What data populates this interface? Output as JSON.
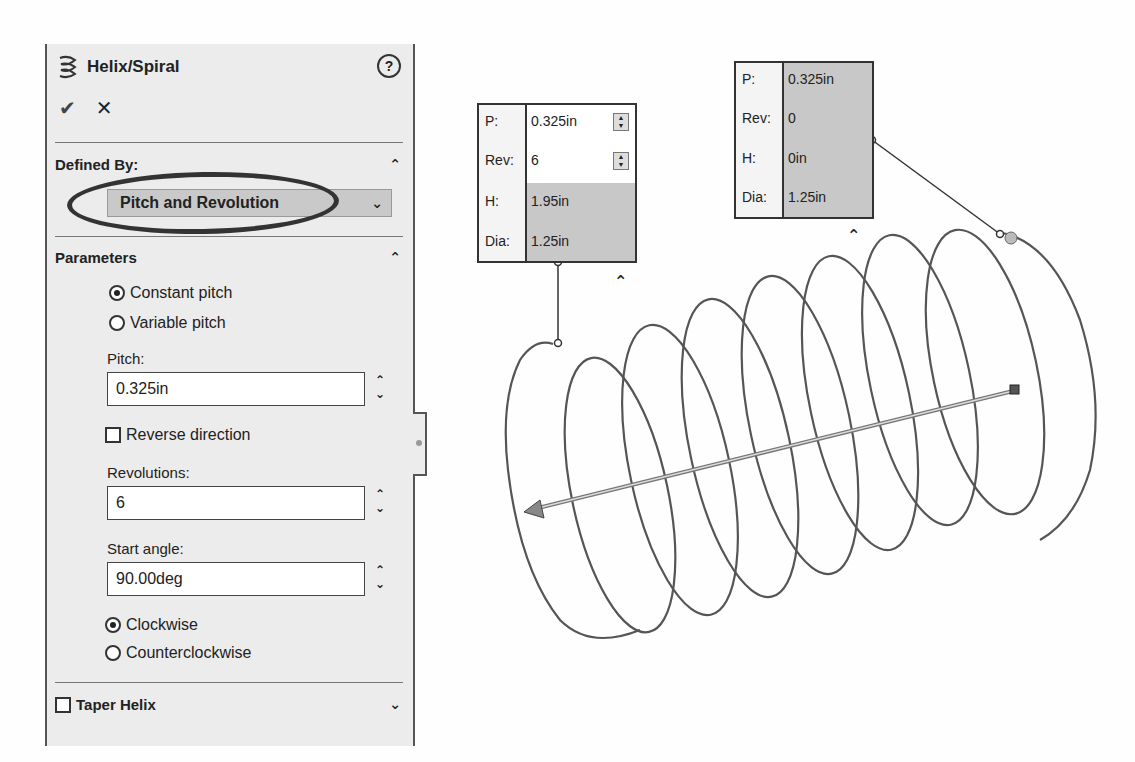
{
  "panel": {
    "title": "Helix/Spiral",
    "help_icon": "?",
    "ok_icon": "✔",
    "cancel_icon": "✕",
    "defined_by": {
      "label": "Defined By:",
      "selected": "Pitch and Revolution",
      "collapse_icon": "⌃",
      "dropdown_icon": "⌄"
    },
    "parameters": {
      "label": "Parameters",
      "collapse_icon": "⌃",
      "pitch_mode": [
        {
          "label": "Constant pitch",
          "selected": true
        },
        {
          "label": "Variable pitch",
          "selected": false
        }
      ],
      "pitch_label": "Pitch:",
      "pitch_value": "0.325in",
      "reverse_direction_label": "Reverse direction",
      "reverse_direction_checked": false,
      "revolutions_label": "Revolutions:",
      "revolutions_value": "6",
      "start_angle_label": "Start angle:",
      "start_angle_value": "90.00deg",
      "direction": [
        {
          "label": "Clockwise",
          "selected": true
        },
        {
          "label": "Counterclockwise",
          "selected": false
        }
      ],
      "spin_up": "⌃",
      "spin_down": "⌄"
    },
    "taper": {
      "label": "Taper Helix",
      "checked": false,
      "expand_icon": "⌄"
    }
  },
  "callout_start": {
    "rows": [
      {
        "key": "P:",
        "value": "0.325in",
        "editable": true
      },
      {
        "key": "Rev:",
        "value": "6",
        "editable": true
      },
      {
        "key": "H:",
        "value": "1.95in",
        "editable": false
      },
      {
        "key": "Dia:",
        "value": "1.25in",
        "editable": false
      }
    ],
    "collapse_icon": "⌃"
  },
  "callout_end": {
    "rows": [
      {
        "key": "P:",
        "value": "0.325in"
      },
      {
        "key": "Rev:",
        "value": "0"
      },
      {
        "key": "H:",
        "value": "0in"
      },
      {
        "key": "Dia:",
        "value": "1.25in"
      }
    ],
    "collapse_icon": "⌃"
  },
  "colors": {
    "panel_bg": "#ececec",
    "helix_stroke": "#555555",
    "highlight_ellipse": "#333333",
    "callout_shade": "#c8c8c8"
  }
}
